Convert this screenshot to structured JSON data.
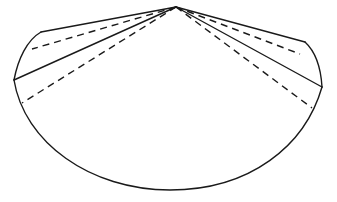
{
  "figure": {
    "kind": "line-drawing",
    "canvas": {
      "width": 337,
      "height": 202,
      "background": "#ffffff"
    },
    "stroke": {
      "color": "#1a1a1a",
      "width": 1.4,
      "dash_pattern": "7 5"
    },
    "points": {
      "apex": {
        "x": 176,
        "y": 7
      },
      "left_upper_corner": {
        "x": 41,
        "y": 32
      },
      "left_vertex": {
        "x": 14,
        "y": 80
      },
      "right_upper_corner": {
        "x": 305,
        "y": 42
      },
      "right_vertex": {
        "x": 322,
        "y": 87
      },
      "bottom_arc_low": {
        "x": 170,
        "y": 190
      }
    },
    "paths": [
      {
        "name": "apex-to-left-upper-corner",
        "style": "solid",
        "d": "M 176 7 L 41 32"
      },
      {
        "name": "left-upper-arc",
        "style": "solid",
        "d": "M 41 32 C 27 40 18 59 14 80"
      },
      {
        "name": "apex-to-left-vertex",
        "style": "solid",
        "d": "M 176 7 L 14 80"
      },
      {
        "name": "bottom-arc",
        "style": "solid",
        "d": "M 14 80 C 24 142 90 190 170 190 C 250 190 305 146 322 87"
      },
      {
        "name": "apex-to-right-vertex",
        "style": "solid",
        "d": "M 176 7 L 322 87"
      },
      {
        "name": "right-upper-arc",
        "style": "solid",
        "d": "M 305 42 C 317 53 321 70 322 87"
      },
      {
        "name": "apex-to-right-upper-corner",
        "style": "solid",
        "d": "M 176 7 L 305 42"
      },
      {
        "name": "hidden-edge-left-upper",
        "style": "dashed",
        "d": "M 176 7 L 32 49"
      },
      {
        "name": "hidden-edge-left-lower",
        "style": "dashed",
        "d": "M 176 7 L 22 103"
      },
      {
        "name": "hidden-edge-right-upper",
        "style": "dashed",
        "d": "M 176 7 L 300 54"
      },
      {
        "name": "hidden-edge-right-lower",
        "style": "dashed",
        "d": "M 176 7 L 312 108"
      }
    ],
    "surfaces": [
      {
        "name": "fan-body-fill",
        "fill": "#ffffff",
        "d": "M 176 7 L 41 32 C 27 40 18 59 14 80 C 24 142 90 190 170 190 C 250 190 305 146 322 87 C 321 70 317 53 305 42 Z"
      }
    ]
  }
}
